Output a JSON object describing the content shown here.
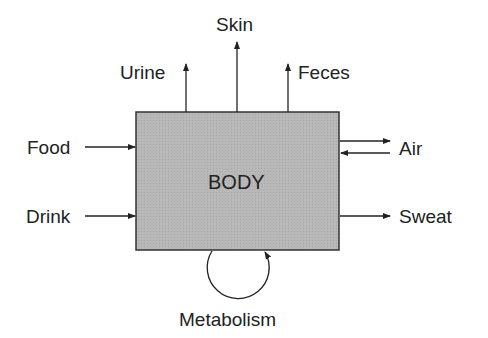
{
  "diagram": {
    "center": {
      "label": "BODY",
      "fill": "#b5b5b5",
      "stroke": "#333333"
    },
    "inputs": [
      {
        "label": "Food"
      },
      {
        "label": "Drink"
      }
    ],
    "outputs_top": [
      {
        "label": "Urine"
      },
      {
        "label": "Skin"
      },
      {
        "label": "Feces"
      }
    ],
    "outputs_right": [
      {
        "label": "Air",
        "bidirectional": true
      },
      {
        "label": "Sweat"
      }
    ],
    "internal": {
      "label": "Metabolism"
    }
  }
}
